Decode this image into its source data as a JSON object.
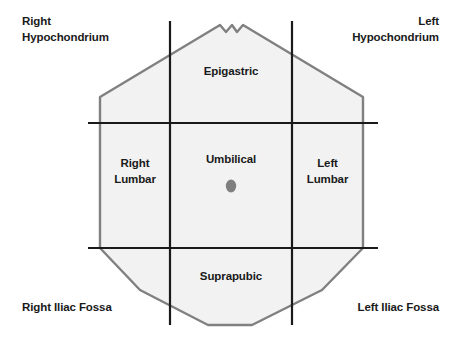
{
  "figure": {
    "fill_color": "#f2f2f2",
    "outline_color": "#808080",
    "grid_color": "#1a1a1a",
    "umbilicus_color": "#7f7f7f",
    "background_color": "#ffffff"
  },
  "corner_labels": {
    "top_left": "Right\nHypochondrium",
    "top_right": "Left\nHypochondrium",
    "bottom_left": "Right Iliac Fossa",
    "bottom_right": "Left Iliac Fossa"
  },
  "regions": {
    "epigastric": "Epigastric",
    "umbilical": "Umbilical",
    "suprapubic": "Suprapubic",
    "right_lumbar": "Right\nLumbar",
    "left_lumbar": "Left\nLumbar"
  },
  "marker": {
    "umbilicus": "umbilicus-marker"
  }
}
